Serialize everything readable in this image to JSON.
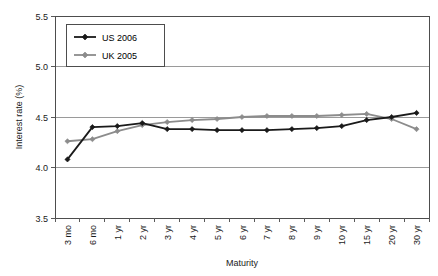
{
  "chart_data": {
    "type": "line",
    "title": "",
    "xlabel": "Maturity",
    "ylabel": "Interest rate (%)",
    "categories": [
      "3 mo",
      "6 mo",
      "1 yr",
      "2 yr",
      "3 yr",
      "4 yr",
      "5 yr",
      "6 yr",
      "7 yr",
      "8 yr",
      "9 yr",
      "10 yr",
      "15 yr",
      "20 yr",
      "30 yr"
    ],
    "ylim": [
      3.5,
      5.5
    ],
    "yticks": [
      "3.5",
      "4.0",
      "4.5",
      "5.0",
      "5.5"
    ],
    "ytick_values": [
      3.5,
      4.0,
      4.5,
      5.0,
      5.5
    ],
    "grid": true,
    "legend_position": "top-left",
    "series": [
      {
        "name": "US 2006",
        "color": "#1a1a1a",
        "marker": "diamond",
        "values": [
          4.08,
          4.4,
          4.41,
          4.44,
          4.38,
          4.38,
          4.37,
          4.37,
          4.37,
          4.38,
          4.39,
          4.41,
          4.47,
          4.5,
          4.54
        ]
      },
      {
        "name": "UK 2005",
        "color": "#8c8c8c",
        "marker": "diamond",
        "values": [
          4.26,
          4.28,
          4.36,
          4.42,
          4.45,
          4.47,
          4.48,
          4.5,
          4.51,
          4.51,
          4.51,
          4.52,
          4.53,
          4.48,
          4.38
        ]
      }
    ]
  },
  "legend": {
    "items": [
      {
        "label": "US 2006",
        "color": "#1a1a1a"
      },
      {
        "label": "UK 2005",
        "color": "#8c8c8c"
      }
    ]
  },
  "axes": {
    "y_title": "Interest rate (%)",
    "x_title": "Maturity"
  }
}
